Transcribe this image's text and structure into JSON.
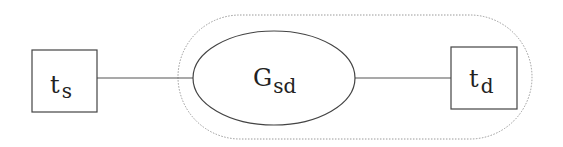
{
  "diagram": {
    "source_node": {
      "base": "t",
      "subscript": "s"
    },
    "graph_node": {
      "base": "G",
      "subscript": "sd"
    },
    "target_node": {
      "base": "t",
      "subscript": "d"
    },
    "edges": [
      {
        "from": "source_node",
        "to": "graph_node"
      },
      {
        "from": "graph_node",
        "to": "target_node"
      }
    ],
    "group": {
      "style": "dotted",
      "contains": [
        "graph_node",
        "target_node"
      ]
    }
  },
  "colors": {
    "stroke": "#444444",
    "group_stroke": "#9a9a9a",
    "background": "#ffffff"
  }
}
